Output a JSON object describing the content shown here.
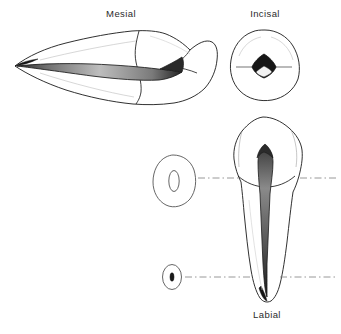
{
  "figure": {
    "background_color": "#ffffff",
    "ink_color": "#1a1a1a",
    "shading_color": "#9a9a9a",
    "leader_line_color": "#8d8d8d",
    "views": [
      {
        "id": "mesial",
        "label": "Mesial",
        "orientation": "horizontal",
        "description": "Longitudinal mesial section, root to left, crown to right, pulp canal shaded"
      },
      {
        "id": "incisal",
        "label": "Incisal",
        "orientation": "occlusal",
        "description": "Rounded triangular outline with dark diamond pulp chamber"
      },
      {
        "id": "labial",
        "label": "Labial",
        "orientation": "vertical",
        "description": "Full tooth, crown above cervical line, long tapering root with pulp canal"
      }
    ],
    "cross_sections": [
      {
        "id": "cervical-third",
        "shape": "ovoid",
        "canal_shape": "oval",
        "level_label": ""
      },
      {
        "id": "apical-third",
        "shape": "oval",
        "canal_shape": "round",
        "level_label": ""
      }
    ],
    "leader_lines": [
      {
        "id": "upper-section-leader",
        "style": "dash-dot"
      },
      {
        "id": "lower-section-leader",
        "style": "dash-dot"
      }
    ]
  },
  "labels": {
    "mesial": "Mesial",
    "incisal": "Incisal",
    "labial": "Labial"
  }
}
